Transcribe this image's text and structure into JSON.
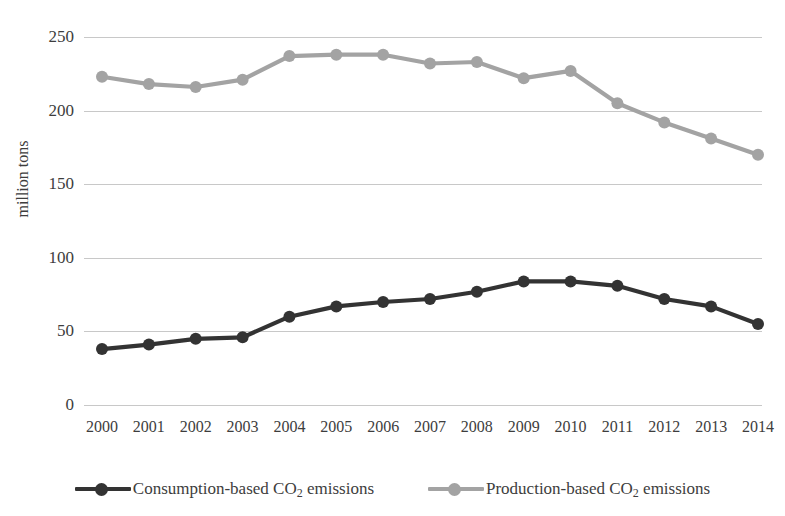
{
  "chart_data": {
    "type": "line",
    "title": "",
    "xlabel": "",
    "ylabel": "million tons",
    "ylim": [
      0,
      250
    ],
    "yticks": [
      0,
      50,
      100,
      150,
      200,
      250
    ],
    "grid": true,
    "legend_position": "bottom",
    "categories": [
      "2000",
      "2001",
      "2002",
      "2003",
      "2004",
      "2005",
      "2006",
      "2007",
      "2008",
      "2009",
      "2010",
      "2011",
      "2012",
      "2013",
      "2014"
    ],
    "series": [
      {
        "name": "Consumption-based CO2 emissions",
        "label_main": "Consumption-based CO",
        "label_sub": "2",
        "label_tail": " emissions",
        "color": "#333333",
        "marker": "circle",
        "values": [
          38,
          41,
          45,
          46,
          60,
          67,
          70,
          72,
          77,
          84,
          84,
          81,
          72,
          67,
          55
        ]
      },
      {
        "name": "Production-based CO2 emissions",
        "label_main": "Production-based CO",
        "label_sub": "2",
        "label_tail": " emissions",
        "color": "#a3a3a3",
        "marker": "circle",
        "values": [
          223,
          218,
          216,
          221,
          237,
          238,
          238,
          232,
          233,
          222,
          227,
          205,
          192,
          181,
          170
        ]
      }
    ]
  },
  "axes": {
    "y_tick_labels": [
      "250",
      "200",
      "150",
      "100",
      "50",
      "0"
    ],
    "y_axis_title": "million tons",
    "x_tick_labels": [
      "2000",
      "2001",
      "2002",
      "2003",
      "2004",
      "2005",
      "2006",
      "2007",
      "2008",
      "2009",
      "2010",
      "2011",
      "2012",
      "2013",
      "2014"
    ]
  },
  "legend": {
    "items": [
      {
        "label": "Consumption-based CO2 emissions",
        "color": "#333333"
      },
      {
        "label": "Production-based CO2 emissions",
        "color": "#a3a3a3"
      }
    ]
  }
}
